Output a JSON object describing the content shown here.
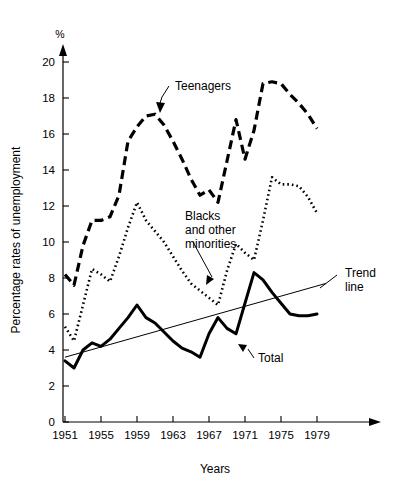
{
  "chart_data": {
    "type": "line",
    "title": "",
    "xlabel": "Years",
    "ylabel": "Percentage rates of unemployment",
    "unit_label": "%",
    "xlim": [
      1951,
      1980
    ],
    "ylim": [
      0,
      21
    ],
    "ytick_labels": [
      "0",
      "2",
      "4",
      "6",
      "8",
      "10",
      "12",
      "14",
      "16",
      "18",
      "20"
    ],
    "ytick_values": [
      0,
      2,
      4,
      6,
      8,
      10,
      12,
      14,
      16,
      18,
      20
    ],
    "xtick_labels": [
      "1951",
      "1955",
      "1959",
      "1963",
      "1967",
      "1971",
      "1975",
      "1979"
    ],
    "xtick_values": [
      1951,
      1955,
      1959,
      1963,
      1967,
      1971,
      1975,
      1979
    ],
    "grid": false,
    "legend": "inline annotations",
    "x": [
      1951,
      1952,
      1953,
      1954,
      1955,
      1956,
      1957,
      1958,
      1959,
      1960,
      1961,
      1962,
      1963,
      1964,
      1965,
      1966,
      1967,
      1968,
      1969,
      1970,
      1971,
      1972,
      1973,
      1974,
      1975,
      1976,
      1977,
      1978,
      1979
    ],
    "series": [
      {
        "name": "Teenagers",
        "style": "dashed",
        "values": [
          8.2,
          7.6,
          9.8,
          11.2,
          11.2,
          11.4,
          12.6,
          15.6,
          16.4,
          17.0,
          17.1,
          16.5,
          15.6,
          14.6,
          13.5,
          12.6,
          12.9,
          12.2,
          14.5,
          16.8,
          14.6,
          16.2,
          18.8,
          18.9,
          18.8,
          18.2,
          17.7,
          17.1,
          16.3
        ]
      },
      {
        "name": "Blacks and other minorities",
        "style": "dotted",
        "values": [
          5.3,
          4.5,
          6.5,
          8.5,
          8.2,
          7.8,
          9.2,
          10.8,
          12.2,
          11.2,
          10.6,
          10.0,
          9.2,
          8.4,
          7.7,
          7.3,
          6.9,
          6.5,
          8.4,
          9.9,
          9.4,
          9.0,
          11.2,
          13.6,
          13.2,
          13.2,
          13.1,
          12.5,
          11.6
        ]
      },
      {
        "name": "Total",
        "style": "solid-thick",
        "values": [
          3.4,
          3.0,
          4.0,
          4.4,
          4.2,
          4.6,
          5.2,
          5.8,
          6.5,
          5.8,
          5.5,
          5.0,
          4.5,
          4.1,
          3.9,
          3.6,
          4.9,
          5.8,
          5.2,
          4.9,
          6.6,
          8.3,
          7.9,
          7.2,
          6.6,
          6.0,
          5.9,
          5.9,
          6.0
        ]
      }
    ],
    "trend_line": {
      "name": "Trend line",
      "style": "solid-thin",
      "start": {
        "x": 1951,
        "y": 3.6
      },
      "end": {
        "x": 1980,
        "y": 7.7
      }
    },
    "annotations": [
      {
        "name": "Teenagers",
        "label": "Teenagers",
        "text_x": 175,
        "text_y": 90,
        "target_x": 160,
        "target_y": 113
      },
      {
        "name": "Blacks and other minorities",
        "label_lines": [
          "Blacks",
          "and other",
          "minorities"
        ],
        "text_x": 185,
        "text_y": 220,
        "target_x": 206,
        "target_y": 285
      },
      {
        "name": "Total",
        "label": "Total",
        "text_x": 258,
        "text_y": 362,
        "target_x": 238,
        "target_y": 344
      },
      {
        "name": "Trend line",
        "label_lines": [
          "Trend",
          "line"
        ],
        "text_x": 345,
        "text_y": 277,
        "target_x": 320,
        "target_y": 288
      }
    ]
  }
}
